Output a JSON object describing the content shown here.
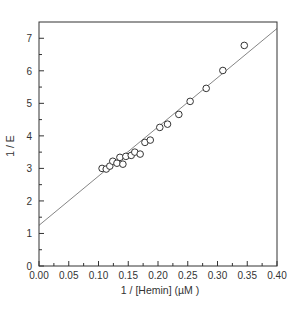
{
  "chart_data": {
    "type": "scatter",
    "title": "",
    "xlabel": "1 / [Hemin] (µM  )",
    "ylabel": "1 / E",
    "xlim": [
      0.0,
      0.4
    ],
    "ylim": [
      0,
      7.5
    ],
    "x_ticks": [
      "0.00",
      "0.05",
      "0.10",
      "0.15",
      "0.20",
      "0.25",
      "0.30",
      "0.35",
      "0.40"
    ],
    "y_ticks": [
      "0",
      "1",
      "2",
      "3",
      "4",
      "5",
      "6",
      "7"
    ],
    "grid": false,
    "legend": null,
    "series": [
      {
        "name": "data",
        "marker": "open-circle",
        "points": [
          [
            0.106,
            3.0
          ],
          [
            0.113,
            2.98
          ],
          [
            0.119,
            3.07
          ],
          [
            0.124,
            3.22
          ],
          [
            0.131,
            3.16
          ],
          [
            0.136,
            3.34
          ],
          [
            0.141,
            3.13
          ],
          [
            0.146,
            3.37
          ],
          [
            0.155,
            3.4
          ],
          [
            0.161,
            3.5
          ],
          [
            0.17,
            3.44
          ],
          [
            0.178,
            3.8
          ],
          [
            0.187,
            3.87
          ],
          [
            0.203,
            4.26
          ],
          [
            0.216,
            4.36
          ],
          [
            0.235,
            4.66
          ],
          [
            0.254,
            5.06
          ],
          [
            0.281,
            5.46
          ],
          [
            0.309,
            6.01
          ],
          [
            0.345,
            6.78
          ]
        ]
      },
      {
        "name": "linear fit",
        "type": "line",
        "points": [
          [
            0.0,
            1.25
          ],
          [
            0.4,
            7.3
          ]
        ]
      }
    ]
  },
  "colors": {
    "axis": "#333333",
    "line": "#777777",
    "marker": "#333333"
  }
}
